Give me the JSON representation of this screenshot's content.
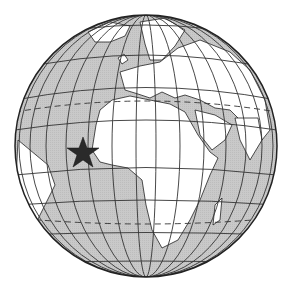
{
  "map": {
    "type": "orthographic-globe",
    "description": "Globe centered on Africa and Europe with a star marker on the West African coast",
    "colors": {
      "ocean": "#c8c8c8",
      "land": "#ffffff",
      "outline": "#222222",
      "grid": "#333333",
      "marker": "#2a2a2a"
    },
    "marker": {
      "symbol": "star",
      "location": "West Africa coast (Senegal / Gambia region)"
    },
    "special_lines": [
      "Tropic of Cancer (dashed)",
      "Tropic of Capricorn (dashed)"
    ]
  }
}
